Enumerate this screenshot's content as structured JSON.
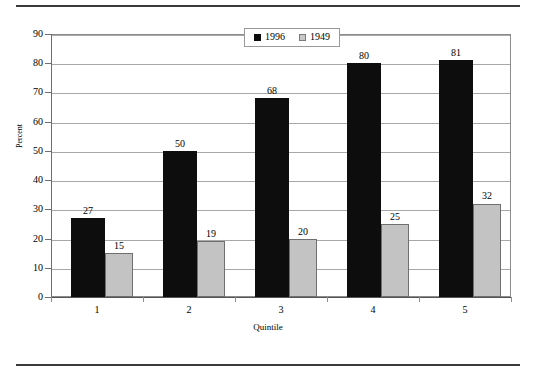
{
  "chart_data": {
    "type": "bar",
    "title": "",
    "xlabel": "Quintile",
    "ylabel": "Percent",
    "categories": [
      "1",
      "2",
      "3",
      "4",
      "5"
    ],
    "series": [
      {
        "name": "1996",
        "color": "#0d0d0d",
        "values": [
          27,
          50,
          68,
          80,
          81
        ]
      },
      {
        "name": "1949",
        "color": "#c3c3c3",
        "values": [
          15,
          19,
          20,
          25,
          32
        ]
      }
    ],
    "ylim": [
      0,
      90
    ],
    "ytick_step": 10,
    "yticks": [
      "90",
      "80",
      "70",
      "60",
      "50",
      "40",
      "30",
      "20",
      "10",
      "0"
    ],
    "grid": true,
    "data_labels": true,
    "legend_position": "top-center"
  },
  "legend": {
    "entries": [
      {
        "label": "1996",
        "swatch": "black-square"
      },
      {
        "label": "1949",
        "swatch": "gray-square"
      }
    ]
  },
  "axes": {
    "x_title": "Quintile",
    "y_title": "Percent"
  },
  "colors": {
    "series_1996": "#0d0d0d",
    "series_1949": "#c3c3c3",
    "gridline": "#a8a8a8",
    "frame": "#8c8c8c",
    "page_rule": "#3a3a3a"
  }
}
